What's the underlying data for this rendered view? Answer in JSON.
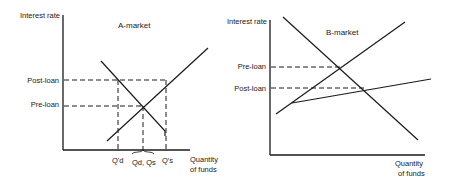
{
  "panels": [
    {
      "title": "A-market",
      "y_axis_label": "Interest rate",
      "x_axis_label_line1": "Quantity",
      "x_axis_label_line2": "of funds",
      "y_levels": [
        {
          "label": "Post-loan"
        },
        {
          "label": "Pre-loan"
        }
      ],
      "x_ticks": [
        {
          "label": "Q'd"
        },
        {
          "label": "Qd, Qs"
        },
        {
          "label": "Q's"
        }
      ],
      "curves": [
        {
          "name": "supply",
          "description": "upward-sloping supply line"
        },
        {
          "name": "demand",
          "description": "downward-sloping demand line ending with vertical drop at Q's"
        }
      ]
    },
    {
      "title": "B-market",
      "y_axis_label": "Interest rate",
      "x_axis_label_line1": "Quantity",
      "x_axis_label_line2": "of funds",
      "y_levels": [
        {
          "label": "Pre-loan"
        },
        {
          "label": "Post-loan"
        }
      ],
      "curves": [
        {
          "name": "demand",
          "description": "steep downward-sloping demand line"
        },
        {
          "name": "supply-pre",
          "description": "upward-sloping supply line"
        },
        {
          "name": "supply-post",
          "description": "flatter supply line after loan"
        }
      ]
    }
  ]
}
